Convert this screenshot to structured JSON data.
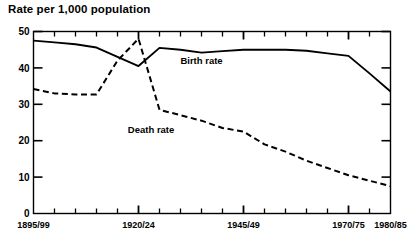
{
  "chart_data": {
    "type": "line",
    "title": "Rate per 1,000 population",
    "xlabel": "",
    "ylabel": "",
    "ylim": [
      0,
      50
    ],
    "yticks": [
      0,
      10,
      20,
      30,
      40,
      50
    ],
    "ytick_labels": [
      "0",
      "10",
      "20",
      "30",
      "40",
      "50"
    ],
    "grid": false,
    "legend_position": "inline-annotation",
    "x": [
      "1895/99",
      "1900/04",
      "1905/09",
      "1910/14",
      "1915/19",
      "1920/24",
      "1925/29",
      "1930/34",
      "1935/39",
      "1940/44",
      "1945/49",
      "1950/54",
      "1955/59",
      "1960/64",
      "1965/69",
      "1970/75",
      "1975/79",
      "1980/85"
    ],
    "xtick_labels_shown": [
      "1895/99",
      "1920/24",
      "1945/49",
      "1970/75",
      "1980/85"
    ],
    "series": [
      {
        "name": "Birth rate",
        "style": "solid",
        "values": [
          47.5,
          47.0,
          46.5,
          45.6,
          43.0,
          40.5,
          45.5,
          45.0,
          44.2,
          44.6,
          45.0,
          45.0,
          45.0,
          44.7,
          44.0,
          43.3,
          38.5,
          33.5
        ]
      },
      {
        "name": "Death rate",
        "style": "dashed",
        "values": [
          34.2,
          33.0,
          32.7,
          32.7,
          42.0,
          48.0,
          28.5,
          27.0,
          25.5,
          23.5,
          22.5,
          19.0,
          17.0,
          14.5,
          12.5,
          10.5,
          9.0,
          7.5
        ]
      }
    ],
    "annotations": [
      {
        "text": "Birth rate",
        "x_index": 8,
        "y_value": 41.0
      },
      {
        "text": "Death rate",
        "x_index": 5.6,
        "y_value": 22.2
      }
    ]
  },
  "axes": {
    "y_tick_labels": [
      "50",
      "40",
      "30",
      "20",
      "10",
      "0"
    ],
    "x_tick_labels": [
      "1895/99",
      "1920/24",
      "1945/49",
      "1970/75",
      "1980/85"
    ]
  },
  "colors": {
    "ink": "#000000",
    "background": "#ffffff"
  }
}
